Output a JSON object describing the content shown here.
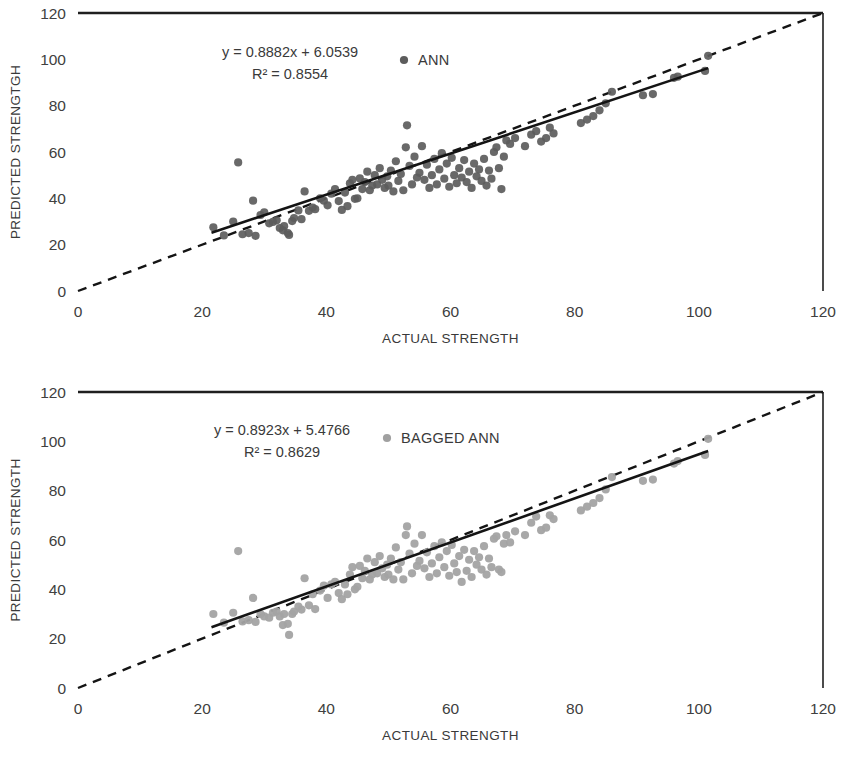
{
  "figure": {
    "background": "#ffffff",
    "panel_count": 2
  },
  "chart_data": [
    {
      "id": "ann",
      "type": "scatter",
      "title": "",
      "xlabel": "ACTUAL STRENGTH",
      "ylabel": "PREDICTED STRENGTGH",
      "xlim": [
        0,
        120
      ],
      "ylim": [
        0,
        120
      ],
      "xticks": [
        0,
        20,
        40,
        60,
        80,
        100,
        120
      ],
      "yticks": [
        0,
        20,
        40,
        60,
        80,
        100,
        120
      ],
      "grid": false,
      "legend": {
        "label": "ANN",
        "position": "top-center-right",
        "marker": "circle",
        "color": "#5c5c5c"
      },
      "annotations": [
        {
          "name": "regression-equation",
          "text": "y = 0.8882x + 6.0539"
        },
        {
          "name": "r-squared",
          "text": "R² = 0.8554"
        }
      ],
      "fit": {
        "slope": 0.8882,
        "intercept": 6.0539,
        "r2": 0.8554,
        "x_from": 21.5,
        "x_to": 101.5,
        "color": "#141414",
        "style": "solid"
      },
      "reference_line": {
        "name": "ideal-1-1-line",
        "from": [
          0,
          0
        ],
        "to": [
          120,
          120
        ],
        "color": "#141414",
        "style": "dashed"
      },
      "marker": {
        "color": "#5c5c5c",
        "size": 8.2,
        "opacity": 0.92
      },
      "points": [
        [
          21.8,
          27.5
        ],
        [
          23.5,
          24.0
        ],
        [
          25.0,
          30.0
        ],
        [
          25.8,
          55.5
        ],
        [
          26.5,
          24.5
        ],
        [
          27.5,
          25.0
        ],
        [
          28.2,
          39.0
        ],
        [
          28.6,
          23.8
        ],
        [
          29.4,
          32.8
        ],
        [
          30.0,
          34.0
        ],
        [
          30.8,
          29.2
        ],
        [
          31.4,
          29.8
        ],
        [
          32.0,
          30.5
        ],
        [
          32.5,
          27.2
        ],
        [
          33.0,
          26.2
        ],
        [
          33.2,
          28.0
        ],
        [
          33.8,
          25.0
        ],
        [
          34.0,
          24.2
        ],
        [
          34.5,
          30.2
        ],
        [
          34.8,
          31.5
        ],
        [
          35.5,
          34.8
        ],
        [
          36.0,
          31.0
        ],
        [
          36.5,
          43.0
        ],
        [
          37.2,
          34.6
        ],
        [
          37.8,
          36.0
        ],
        [
          38.2,
          35.3
        ],
        [
          39.0,
          40.0
        ],
        [
          39.6,
          39.0
        ],
        [
          40.2,
          37.0
        ],
        [
          40.8,
          42.0
        ],
        [
          41.4,
          44.0
        ],
        [
          42.0,
          38.8
        ],
        [
          42.5,
          35.0
        ],
        [
          43.0,
          42.5
        ],
        [
          43.4,
          36.6
        ],
        [
          43.8,
          46.5
        ],
        [
          44.2,
          48.0
        ],
        [
          44.6,
          39.8
        ],
        [
          45.0,
          40.0
        ],
        [
          45.4,
          48.6
        ],
        [
          45.8,
          44.0
        ],
        [
          46.2,
          47.0
        ],
        [
          46.6,
          51.5
        ],
        [
          47.0,
          43.5
        ],
        [
          47.4,
          45.5
        ],
        [
          47.8,
          50.0
        ],
        [
          48.2,
          46.0
        ],
        [
          48.6,
          53.0
        ],
        [
          49.0,
          48.0
        ],
        [
          49.4,
          44.5
        ],
        [
          49.8,
          49.5
        ],
        [
          50.0,
          45.5
        ],
        [
          50.4,
          52.0
        ],
        [
          50.8,
          43.0
        ],
        [
          51.2,
          56.0
        ],
        [
          51.6,
          47.5
        ],
        [
          52.0,
          50.5
        ],
        [
          52.4,
          43.5
        ],
        [
          52.8,
          62.0
        ],
        [
          53.0,
          71.5
        ],
        [
          53.4,
          54.0
        ],
        [
          53.8,
          46.0
        ],
        [
          54.2,
          58.0
        ],
        [
          54.6,
          49.0
        ],
        [
          55.0,
          51.0
        ],
        [
          55.4,
          62.5
        ],
        [
          55.8,
          48.0
        ],
        [
          56.2,
          54.5
        ],
        [
          56.6,
          44.5
        ],
        [
          57.0,
          50.0
        ],
        [
          57.4,
          57.0
        ],
        [
          57.8,
          46.0
        ],
        [
          58.2,
          52.5
        ],
        [
          58.6,
          59.5
        ],
        [
          59.0,
          48.5
        ],
        [
          59.4,
          55.0
        ],
        [
          59.8,
          45.0
        ],
        [
          60.2,
          57.5
        ],
        [
          60.6,
          50.0
        ],
        [
          61.0,
          46.5
        ],
        [
          61.4,
          53.0
        ],
        [
          61.8,
          49.0
        ],
        [
          62.2,
          56.5
        ],
        [
          62.6,
          47.0
        ],
        [
          63.0,
          51.5
        ],
        [
          63.4,
          44.5
        ],
        [
          63.8,
          55.0
        ],
        [
          64.2,
          49.5
        ],
        [
          64.6,
          52.5
        ],
        [
          65.0,
          47.5
        ],
        [
          65.4,
          57.0
        ],
        [
          65.8,
          45.5
        ],
        [
          66.2,
          52.0
        ],
        [
          66.6,
          48.5
        ],
        [
          67.0,
          60.0
        ],
        [
          67.4,
          62.0
        ],
        [
          67.8,
          53.0
        ],
        [
          68.2,
          44.0
        ],
        [
          68.6,
          58.0
        ],
        [
          69.0,
          65.0
        ],
        [
          69.6,
          63.5
        ],
        [
          70.4,
          66.0
        ],
        [
          72.0,
          62.5
        ],
        [
          73.0,
          67.5
        ],
        [
          73.8,
          69.0
        ],
        [
          74.6,
          64.5
        ],
        [
          75.4,
          66.0
        ],
        [
          76.0,
          70.5
        ],
        [
          76.6,
          68.0
        ],
        [
          81.0,
          72.5
        ],
        [
          82.0,
          74.0
        ],
        [
          83.0,
          75.5
        ],
        [
          84.0,
          78.0
        ],
        [
          85.0,
          81.0
        ],
        [
          86.0,
          86.0
        ],
        [
          91.0,
          84.5
        ],
        [
          92.6,
          85.0
        ],
        [
          96.0,
          92.0
        ],
        [
          96.6,
          92.5
        ],
        [
          101.0,
          95.0
        ],
        [
          101.5,
          101.5
        ]
      ]
    },
    {
      "id": "bagged-ann",
      "type": "scatter",
      "title": "",
      "xlabel": "ACTUAL STRENGTH",
      "ylabel": "PREDICTED STRENGTH",
      "xlim": [
        0,
        120
      ],
      "ylim": [
        0,
        120
      ],
      "xticks": [
        0,
        20,
        40,
        60,
        80,
        100,
        120
      ],
      "yticks": [
        0,
        20,
        40,
        60,
        80,
        100,
        120
      ],
      "grid": false,
      "legend": {
        "label": "BAGGED ANN",
        "position": "top-center-right",
        "marker": "circle",
        "color": "#a0a0a0"
      },
      "annotations": [
        {
          "name": "regression-equation",
          "text": "y = 0.8923x + 5.4766"
        },
        {
          "name": "r-squared",
          "text": "R² = 0.8629"
        }
      ],
      "fit": {
        "slope": 0.8923,
        "intercept": 5.4766,
        "r2": 0.8629,
        "x_from": 21.5,
        "x_to": 101.5,
        "color": "#141414",
        "style": "solid"
      },
      "reference_line": {
        "name": "ideal-1-1-line",
        "from": [
          0,
          0
        ],
        "to": [
          120,
          120
        ],
        "color": "#141414",
        "style": "dashed"
      },
      "marker": {
        "color": "#a3a3a3",
        "size": 8.2,
        "opacity": 0.95
      },
      "points": [
        [
          21.8,
          30.0
        ],
        [
          23.5,
          26.5
        ],
        [
          25.0,
          30.5
        ],
        [
          25.8,
          55.5
        ],
        [
          26.5,
          27.0
        ],
        [
          27.5,
          27.5
        ],
        [
          28.2,
          36.5
        ],
        [
          28.6,
          26.8
        ],
        [
          29.4,
          30.0
        ],
        [
          30.0,
          29.0
        ],
        [
          30.8,
          28.5
        ],
        [
          31.4,
          30.5
        ],
        [
          32.0,
          31.0
        ],
        [
          32.5,
          29.0
        ],
        [
          33.0,
          25.5
        ],
        [
          33.2,
          30.0
        ],
        [
          33.8,
          26.0
        ],
        [
          34.0,
          21.5
        ],
        [
          34.5,
          30.0
        ],
        [
          34.8,
          31.0
        ],
        [
          35.5,
          33.0
        ],
        [
          36.0,
          31.8
        ],
        [
          36.5,
          44.5
        ],
        [
          37.2,
          33.5
        ],
        [
          37.8,
          38.0
        ],
        [
          38.2,
          32.0
        ],
        [
          39.0,
          39.5
        ],
        [
          39.6,
          41.5
        ],
        [
          40.2,
          36.5
        ],
        [
          40.8,
          42.0
        ],
        [
          41.4,
          43.0
        ],
        [
          42.0,
          38.5
        ],
        [
          42.5,
          36.0
        ],
        [
          43.0,
          42.0
        ],
        [
          43.4,
          38.0
        ],
        [
          43.8,
          46.0
        ],
        [
          44.2,
          49.0
        ],
        [
          44.6,
          40.0
        ],
        [
          45.0,
          41.0
        ],
        [
          45.4,
          49.5
        ],
        [
          45.8,
          44.5
        ],
        [
          46.2,
          47.5
        ],
        [
          46.6,
          52.5
        ],
        [
          47.0,
          44.0
        ],
        [
          47.4,
          46.0
        ],
        [
          47.8,
          51.0
        ],
        [
          48.2,
          46.5
        ],
        [
          48.6,
          53.5
        ],
        [
          49.0,
          48.5
        ],
        [
          49.4,
          45.0
        ],
        [
          49.8,
          50.0
        ],
        [
          50.0,
          46.0
        ],
        [
          50.4,
          52.5
        ],
        [
          50.8,
          44.0
        ],
        [
          51.2,
          57.0
        ],
        [
          51.6,
          48.0
        ],
        [
          52.0,
          51.0
        ],
        [
          52.4,
          44.0
        ],
        [
          52.8,
          62.0
        ],
        [
          53.0,
          65.5
        ],
        [
          53.4,
          54.5
        ],
        [
          53.8,
          46.5
        ],
        [
          54.2,
          58.5
        ],
        [
          54.6,
          49.5
        ],
        [
          55.0,
          51.5
        ],
        [
          55.4,
          62.0
        ],
        [
          55.8,
          48.5
        ],
        [
          56.2,
          55.0
        ],
        [
          56.6,
          45.0
        ],
        [
          57.0,
          50.5
        ],
        [
          57.4,
          57.5
        ],
        [
          57.8,
          46.5
        ],
        [
          58.2,
          53.0
        ],
        [
          58.6,
          59.0
        ],
        [
          59.0,
          49.0
        ],
        [
          59.4,
          55.5
        ],
        [
          59.8,
          45.5
        ],
        [
          60.2,
          58.0
        ],
        [
          60.6,
          50.5
        ],
        [
          61.0,
          47.0
        ],
        [
          61.4,
          53.5
        ],
        [
          61.8,
          43.0
        ],
        [
          62.2,
          56.0
        ],
        [
          62.6,
          47.5
        ],
        [
          63.0,
          52.0
        ],
        [
          63.4,
          45.0
        ],
        [
          63.8,
          55.5
        ],
        [
          64.2,
          50.0
        ],
        [
          64.6,
          53.0
        ],
        [
          65.0,
          48.0
        ],
        [
          65.4,
          57.5
        ],
        [
          65.8,
          46.0
        ],
        [
          66.2,
          52.5
        ],
        [
          66.6,
          49.0
        ],
        [
          67.0,
          60.5
        ],
        [
          67.4,
          61.5
        ],
        [
          67.8,
          48.0
        ],
        [
          68.2,
          47.0
        ],
        [
          68.6,
          58.5
        ],
        [
          69.0,
          62.0
        ],
        [
          69.6,
          59.0
        ],
        [
          70.4,
          63.5
        ],
        [
          72.0,
          62.0
        ],
        [
          73.0,
          67.0
        ],
        [
          73.8,
          69.5
        ],
        [
          74.6,
          64.0
        ],
        [
          75.4,
          65.0
        ],
        [
          76.0,
          70.0
        ],
        [
          76.6,
          68.5
        ],
        [
          81.0,
          72.0
        ],
        [
          82.0,
          73.5
        ],
        [
          83.0,
          75.0
        ],
        [
          84.0,
          77.0
        ],
        [
          85.0,
          80.5
        ],
        [
          86.0,
          85.5
        ],
        [
          91.0,
          84.0
        ],
        [
          92.6,
          84.5
        ],
        [
          96.0,
          91.0
        ],
        [
          96.6,
          92.0
        ],
        [
          101.0,
          94.5
        ],
        [
          101.5,
          101.0
        ]
      ]
    }
  ]
}
